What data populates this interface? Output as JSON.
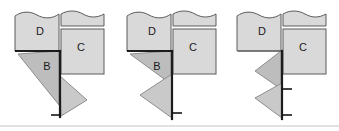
{
  "figure": {
    "background_color": "#ffffff",
    "canvas": {
      "width": 339,
      "height": 131
    }
  },
  "colors": {
    "region_light": "#d9d9d9",
    "region_mid": "#bdbdbd",
    "flap": "#c9c9c9",
    "outline": "#5a5a5a",
    "crease_heavy": "#1c1c1c",
    "tick": "#141414",
    "baseline": "#c4c4c4",
    "label_text": "#1a1a1a"
  },
  "panels": [
    {
      "id": "panel-1",
      "step": "1",
      "labels": [
        {
          "name": "region-d",
          "text": "D",
          "x": 40,
          "y": 32
        },
        {
          "name": "region-c",
          "text": "C",
          "x": 81,
          "y": 48
        },
        {
          "name": "region-b",
          "text": "B",
          "x": 47,
          "y": 67
        }
      ],
      "tick_count": 1
    },
    {
      "id": "panel-2",
      "step": "2",
      "labels": [
        {
          "name": "region-d",
          "text": "D",
          "x": 152,
          "y": 32
        },
        {
          "name": "region-c",
          "text": "C",
          "x": 193,
          "y": 48
        },
        {
          "name": "region-b",
          "text": "B",
          "x": 157,
          "y": 67
        }
      ],
      "tick_count": 1
    },
    {
      "id": "panel-3",
      "step": "3",
      "labels": [
        {
          "name": "region-d",
          "text": "D",
          "x": 262,
          "y": 32
        },
        {
          "name": "region-c",
          "text": "C",
          "x": 303,
          "y": 48
        }
      ],
      "tick_count": 2
    }
  ]
}
